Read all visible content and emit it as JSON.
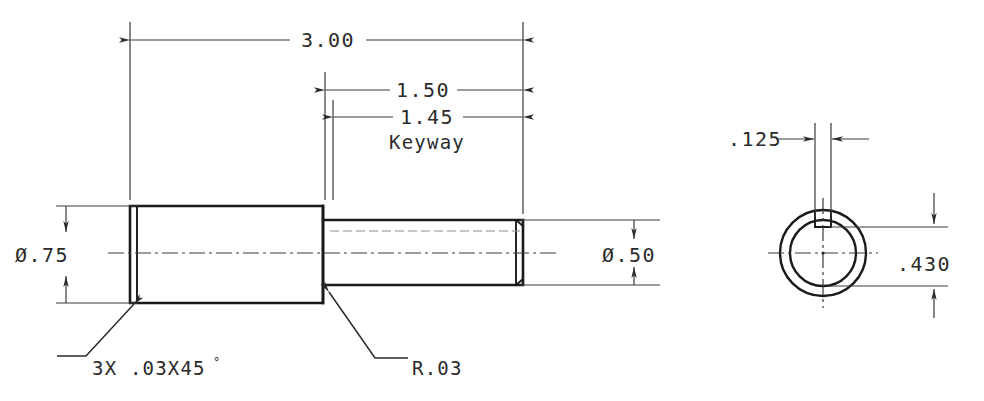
{
  "drawing": {
    "title": "Shaft with Keyway - Detail Drawing",
    "units": "inch",
    "line_color": "#1a1a1a",
    "dim_color": "#3a3a3a",
    "background": "#ffffff"
  },
  "front_view": {
    "name": "front-view",
    "dimensions": {
      "overall_length": "3.00",
      "shoulder_to_end": "1.50",
      "keyway_length": "1.45",
      "keyway_label": "Keyway",
      "large_diameter": "Ø.75",
      "small_diameter": "Ø.50"
    },
    "notes": {
      "chamfer": "3X .03X45",
      "chamfer_degree_symbol": "°",
      "fillet_radius": "R.03"
    }
  },
  "end_view": {
    "name": "end-view",
    "dimensions": {
      "keyway_width": ".125",
      "keyway_depth_across": ".430"
    }
  }
}
